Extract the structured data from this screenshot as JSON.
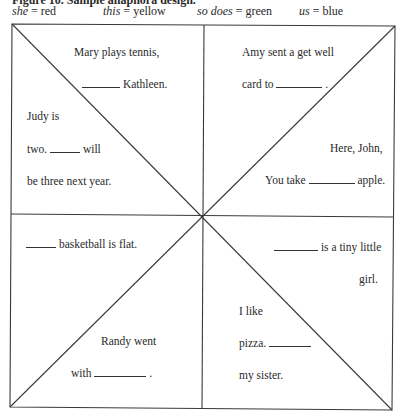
{
  "caption": "Figure 10. Sample anaphora design.",
  "legend": [
    {
      "word": "she",
      "color_name": "red",
      "color": "#cc0000"
    },
    {
      "word": "this",
      "color_name": "yellow",
      "color": "#e6c800"
    },
    {
      "word": "so does",
      "color_name": "green",
      "color": "#2e8b2e"
    },
    {
      "word": "us",
      "color_name": "blue",
      "color": "#1f4fbf"
    }
  ],
  "legend_sep": " = ",
  "quadrants": {
    "top_left": {
      "upper": {
        "line1": "Mary plays tennis,",
        "line2_after": "Kathleen."
      },
      "lower": {
        "line1": "Judy is",
        "line2_before": "two.",
        "line2_after": "will",
        "line3": "be three next year."
      }
    },
    "top_right": {
      "upper": {
        "line1": "Amy sent a get well",
        "line2_before": "card to",
        "line2_after": "."
      },
      "lower": {
        "line1": "Here, John,",
        "line2_before": "You take",
        "line2_after": "apple."
      }
    },
    "bottom_left": {
      "upper": {
        "line1_after": "basketball is flat."
      },
      "lower": {
        "line1": "Randy went",
        "line2_before": "with",
        "line2_after": "."
      }
    },
    "bottom_right": {
      "upper": {
        "line1_after": "is a tiny little",
        "line2": "girl."
      },
      "lower": {
        "line1": "I like",
        "line2_before": "pizza.",
        "line3": "my sister."
      }
    }
  }
}
